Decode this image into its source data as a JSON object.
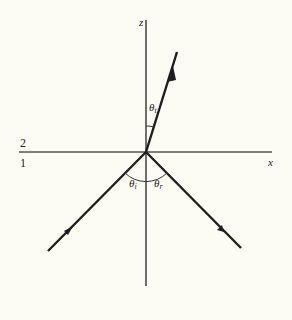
{
  "diagram": {
    "axes": {
      "vertical_label": "z",
      "horizontal_label": "x"
    },
    "media": {
      "upper": "2",
      "lower": "1"
    },
    "angles": {
      "transmitted": {
        "symbol": "θ",
        "subscript": "t"
      },
      "incident": {
        "symbol": "θ",
        "subscript": "i"
      },
      "reflected": {
        "symbol": "θ",
        "subscript": "r"
      }
    },
    "rays": [
      "incident",
      "reflected",
      "transmitted"
    ],
    "colors": {
      "background": "#fdfcf4",
      "ink": "#1e1e1e",
      "interface": "#555555"
    }
  }
}
